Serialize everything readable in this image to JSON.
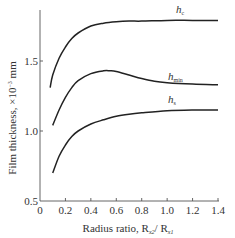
{
  "chart_data": {
    "type": "line",
    "title": "",
    "xlabel": "Radius ratio, R",
    "xlabel_sub1": "x2",
    "xlabel_mid": "/ R",
    "xlabel_sub2": "x1",
    "ylabel": "Film thickness, ×10",
    "ylabel_exp": "−3",
    "ylabel_unit": " mm",
    "xlim": [
      0,
      1.4
    ],
    "ylim": [
      0.5,
      1.8
    ],
    "xticks": [
      0,
      0.2,
      0.4,
      0.6,
      0.8,
      1.0,
      1.2,
      1.4
    ],
    "xtick_labels": [
      "0",
      "0.2",
      "0.4",
      "0.6",
      "0.8",
      "1.0",
      "1.2",
      "1.4"
    ],
    "yticks": [
      0.5,
      1.0,
      1.5
    ],
    "ytick_labels": [
      "0.5",
      "1.0",
      "1.5"
    ],
    "grid": false,
    "series": [
      {
        "name": "h_c",
        "label_main": "h",
        "label_sub": "c",
        "x": [
          0.08,
          0.1,
          0.15,
          0.2,
          0.25,
          0.3,
          0.4,
          0.5,
          0.6,
          0.7,
          0.8,
          1.0,
          1.2,
          1.4
        ],
        "y": [
          1.31,
          1.4,
          1.52,
          1.6,
          1.66,
          1.7,
          1.75,
          1.77,
          1.78,
          1.785,
          1.785,
          1.79,
          1.79,
          1.79
        ]
      },
      {
        "name": "h_min",
        "label_main": "h",
        "label_sub": "min",
        "x": [
          0.1,
          0.15,
          0.2,
          0.25,
          0.3,
          0.4,
          0.5,
          0.55,
          0.6,
          0.7,
          0.8,
          0.9,
          1.0,
          1.2,
          1.4
        ],
        "y": [
          1.04,
          1.15,
          1.24,
          1.31,
          1.36,
          1.41,
          1.43,
          1.43,
          1.425,
          1.4,
          1.375,
          1.355,
          1.345,
          1.335,
          1.33
        ]
      },
      {
        "name": "h_s",
        "label_main": "h",
        "label_sub": "s",
        "x": [
          0.1,
          0.15,
          0.2,
          0.25,
          0.3,
          0.4,
          0.5,
          0.6,
          0.7,
          0.8,
          1.0,
          1.2,
          1.4
        ],
        "y": [
          0.7,
          0.82,
          0.9,
          0.96,
          1.0,
          1.05,
          1.08,
          1.105,
          1.12,
          1.13,
          1.145,
          1.15,
          1.15
        ]
      }
    ]
  }
}
